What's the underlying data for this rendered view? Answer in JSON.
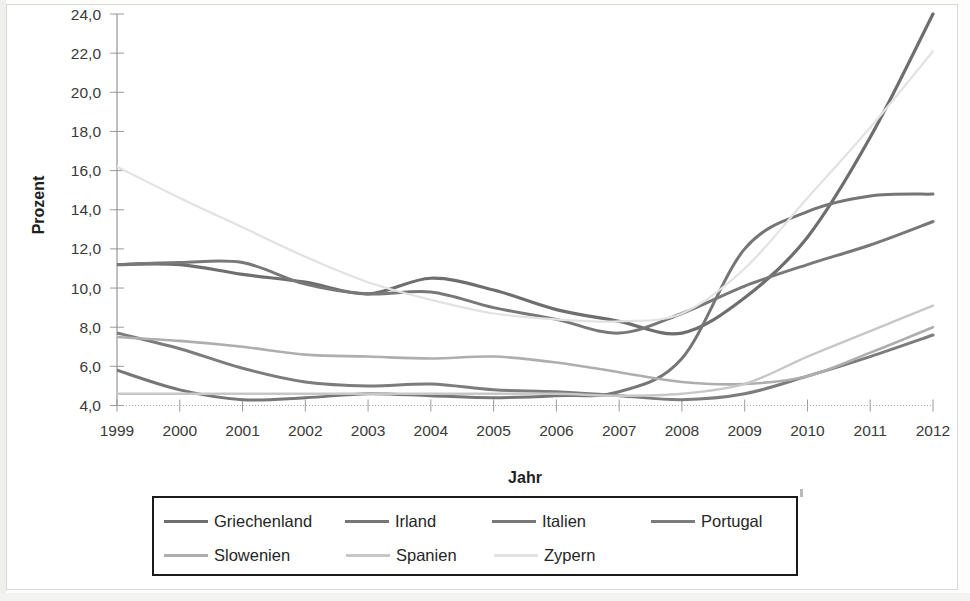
{
  "chart_data": {
    "type": "line",
    "title": "",
    "xlabel": "Jahr",
    "ylabel": "Prozent",
    "grid": false,
    "legend_position": "bottom",
    "x": [
      1999,
      2000,
      2001,
      2002,
      2003,
      2004,
      2005,
      2006,
      2007,
      2008,
      2009,
      2010,
      2011,
      2012
    ],
    "categories": [
      "1999",
      "2000",
      "2001",
      "2002",
      "2003",
      "2004",
      "2005",
      "2006",
      "2007",
      "2008",
      "2009",
      "2010",
      "2011",
      "2012"
    ],
    "xlim": [
      1999,
      2012
    ],
    "ylim": [
      4.0,
      24.0
    ],
    "ytick_values": [
      4.0,
      6.0,
      8.0,
      10.0,
      12.0,
      14.0,
      16.0,
      18.0,
      20.0,
      22.0,
      24.0
    ],
    "ytick_labels": [
      "4,0",
      "6,0",
      "8,0",
      "10,0",
      "12,0",
      "14,0",
      "16,0",
      "18,0",
      "20,0",
      "22,0",
      "24,0"
    ],
    "series": [
      {
        "name": "Griechenland",
        "color": "#6e6e6e",
        "width": 3.2,
        "values": [
          11.2,
          11.2,
          10.7,
          10.3,
          9.7,
          10.5,
          9.9,
          8.9,
          8.3,
          7.7,
          9.5,
          12.6,
          17.7,
          24.3
        ]
      },
      {
        "name": "Irland",
        "color": "#767676",
        "width": 3.0,
        "values": [
          5.8,
          4.8,
          4.3,
          4.4,
          4.6,
          4.5,
          4.4,
          4.5,
          4.7,
          6.4,
          12.0,
          13.9,
          14.7,
          14.8
        ]
      },
      {
        "name": "Italien",
        "color": "#787878",
        "width": 3.0,
        "values": [
          11.2,
          11.3,
          11.3,
          10.2,
          9.7,
          9.8,
          9.0,
          8.4,
          7.7,
          8.7,
          10.1,
          11.2,
          12.2,
          13.4
        ]
      },
      {
        "name": "Portugal",
        "color": "#7c7c7c",
        "width": 3.0,
        "values": [
          7.7,
          6.9,
          5.9,
          5.2,
          5.0,
          5.1,
          4.8,
          4.7,
          4.5,
          4.3,
          4.6,
          5.5,
          6.5,
          7.6
        ]
      },
      {
        "name": "Slowenien",
        "color": "#aeaeae",
        "width": 2.6,
        "values": [
          7.5,
          7.3,
          7.0,
          6.6,
          6.5,
          6.4,
          6.5,
          6.2,
          5.7,
          5.2,
          5.1,
          5.5,
          6.7,
          8.0
        ]
      },
      {
        "name": "Spanien",
        "color": "#c7c7c7",
        "width": 2.4,
        "values": [
          4.6,
          4.6,
          4.6,
          4.6,
          4.6,
          4.6,
          4.6,
          4.6,
          4.5,
          4.6,
          5.1,
          6.5,
          7.8,
          9.1
        ]
      },
      {
        "name": "Zypern",
        "color": "#e2e2e2",
        "width": 2.2,
        "values": [
          16.2,
          14.6,
          13.1,
          11.6,
          10.3,
          9.4,
          8.7,
          8.4,
          8.3,
          8.7,
          11.0,
          14.6,
          18.2,
          22.1
        ]
      }
    ]
  },
  "axes": {
    "y_title": "Prozent",
    "x_title": "Jahr"
  },
  "legend": {
    "row1": [
      {
        "label": "Griechenland",
        "color": "#6e6e6e"
      },
      {
        "label": "Irland",
        "color": "#767676"
      },
      {
        "label": "Italien",
        "color": "#787878"
      },
      {
        "label": "Portugal",
        "color": "#7c7c7c"
      }
    ],
    "row2": [
      {
        "label": "Slowenien",
        "color": "#aeaeae"
      },
      {
        "label": "Spanien",
        "color": "#c7c7c7"
      },
      {
        "label": "Zypern",
        "color": "#e2e2e2"
      }
    ]
  }
}
